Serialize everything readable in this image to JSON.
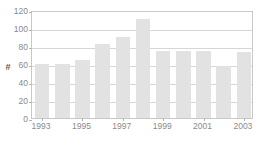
{
  "chart_data": {
    "type": "bar",
    "title": "",
    "xlabel": "",
    "ylabel": "#",
    "ylim": [
      0,
      120
    ],
    "ytick_step": 20,
    "yticks": [
      0,
      20,
      40,
      60,
      80,
      100,
      120
    ],
    "ytick_labels": [
      "0",
      "20",
      "40",
      "60",
      "80",
      "100",
      "120"
    ],
    "grid": true,
    "grid_axis": "y",
    "legend": false,
    "categories": [
      1993,
      1994,
      1995,
      1996,
      1997,
      1998,
      1999,
      2000,
      2001,
      2002,
      2003
    ],
    "category_labels": [
      "1993",
      "1994",
      "1995",
      "1996",
      "1997",
      "1998",
      "1999",
      "2000",
      "2001",
      "2002",
      "2003"
    ],
    "xtick_labels": [
      "1993",
      "1995",
      "1997",
      "1999",
      "2001",
      "2003"
    ],
    "xtick_values": [
      1993,
      1995,
      1997,
      1999,
      2001,
      2003
    ],
    "values": [
      60,
      60,
      64,
      82,
      90,
      110,
      75,
      75,
      74,
      58,
      73
    ],
    "series": [
      {
        "name": "#",
        "values": [
          60,
          60,
          64,
          82,
          90,
          110,
          75,
          75,
          74,
          58,
          73
        ]
      }
    ]
  },
  "style": {
    "bar_color": "#e2e2e2",
    "gridline_color": "#d6d6d6",
    "frame_color": "#c8c8c8",
    "tick_label_color": "#8a8a8a",
    "axis_title_color": "#5a5a5a",
    "background_color": "#ffffff"
  }
}
